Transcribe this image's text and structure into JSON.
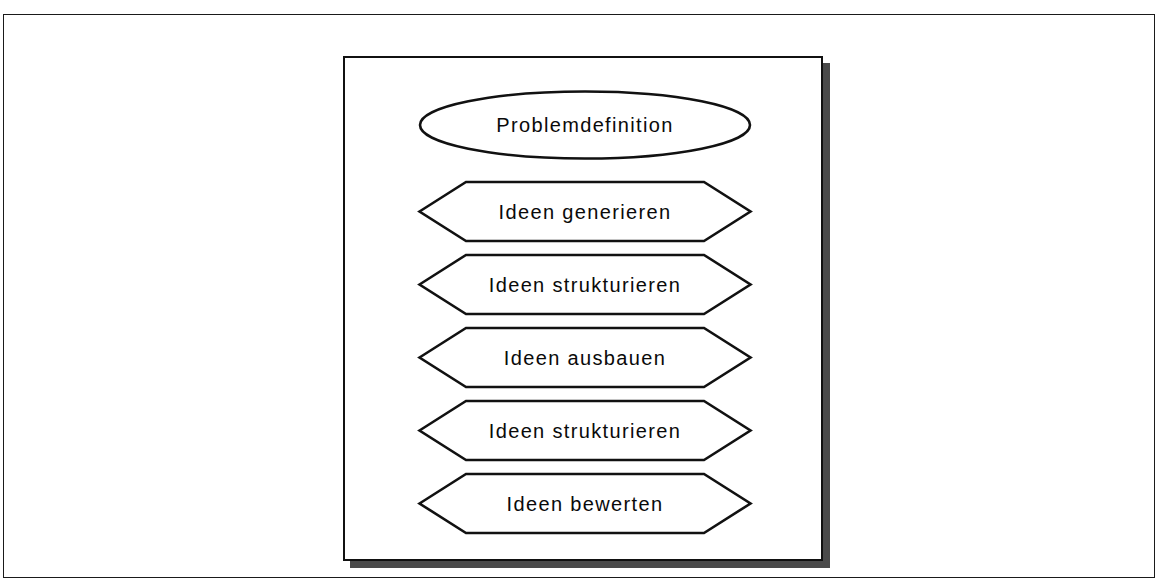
{
  "diagram": {
    "title": "Problemdefinition",
    "frame": {
      "border_color": "#1a1a1a",
      "background": "#ffffff"
    },
    "panel": {
      "border_color": "#111111",
      "shadow_color": "#4a4a4a",
      "background": "#ffffff"
    },
    "shapes": [
      {
        "id": "start-node",
        "type": "ellipse",
        "label": "Problemdefinition"
      },
      {
        "id": "step-1",
        "type": "hexagon",
        "label": "Ideen generieren"
      },
      {
        "id": "step-2",
        "type": "hexagon",
        "label": "Ideen strukturieren"
      },
      {
        "id": "step-3",
        "type": "hexagon",
        "label": "Ideen ausbauen"
      },
      {
        "id": "step-4",
        "type": "hexagon",
        "label": "Ideen strukturieren"
      },
      {
        "id": "step-5",
        "type": "hexagon",
        "label": "Ideen bewerten"
      }
    ]
  }
}
